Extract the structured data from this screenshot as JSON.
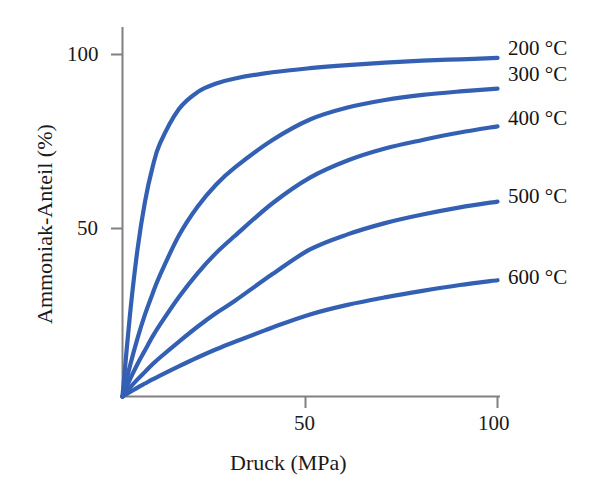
{
  "chart_data": {
    "type": "line",
    "title": "",
    "subtitle": "",
    "xlabel": "Druck (MPa)",
    "ylabel": "Ammoniak-Anteil (%)",
    "xlim": [
      0,
      105
    ],
    "ylim": [
      0,
      108
    ],
    "xticks": [
      50,
      100
    ],
    "xtick_labels": [
      "50",
      "100"
    ],
    "yticks": [
      50,
      100
    ],
    "ytick_labels": [
      "50",
      "100"
    ],
    "grid": false,
    "legend_position": "right-inline-labels",
    "line_color": "#3460b4",
    "axis_color": "#808080",
    "x": [
      0,
      2,
      4,
      6,
      8,
      10,
      15,
      20,
      25,
      30,
      40,
      50,
      60,
      70,
      80,
      90,
      100
    ],
    "series": [
      {
        "name": "200 °C",
        "label": "200 °C",
        "color": "#3460b4",
        "values": [
          0,
          24,
          43,
          57,
          67,
          74,
          84,
          89,
          91.5,
          93,
          94.8,
          96,
          96.9,
          97.6,
          98.2,
          98.6,
          99
        ]
      },
      {
        "name": "300 °C",
        "label": "300 °C",
        "color": "#3460b4",
        "values": [
          0,
          9,
          17,
          24,
          30,
          35.5,
          47,
          55.5,
          62,
          67,
          75,
          81,
          84.5,
          86.7,
          88.2,
          89.2,
          90
        ]
      },
      {
        "name": "400 °C",
        "label": "400 °C",
        "color": "#3460b4",
        "values": [
          0,
          5,
          9.5,
          13.5,
          17.5,
          21,
          29,
          36,
          42,
          47,
          56.5,
          64,
          69,
          72.5,
          75,
          77.2,
          79
        ]
      },
      {
        "name": "500 °C",
        "label": "500 °C",
        "color": "#3460b4",
        "values": [
          0,
          2.6,
          5,
          7.2,
          9.4,
          11.4,
          16,
          20.4,
          24.4,
          28,
          35.8,
          43,
          47.4,
          50.7,
          53.2,
          55.3,
          57
        ]
      },
      {
        "name": "600 °C",
        "label": "600 °C",
        "color": "#3460b4",
        "values": [
          0,
          1.3,
          2.6,
          3.8,
          5,
          6.1,
          8.8,
          11.4,
          13.8,
          16,
          20.2,
          24,
          26.8,
          29,
          30.9,
          32.6,
          34
        ]
      }
    ]
  },
  "axes": {
    "ylabel": "Ammoniak-Anteil (%)",
    "xlabel": "Druck (MPa)",
    "ytick_100": "100",
    "ytick_50": "50",
    "xtick_50": "50",
    "xtick_100": "100"
  },
  "labels": {
    "s200": "200 °C",
    "s300": "300 °C",
    "s400": "400 °C",
    "s500": "500 °C",
    "s600": "600 °C"
  }
}
